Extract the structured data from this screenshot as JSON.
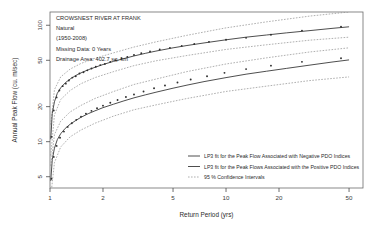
{
  "chart_data": {
    "type": "line",
    "title": "",
    "xlabel": "Return Period (yrs)",
    "ylabel": "Annual Peak Flow (cu. m/sec)",
    "xscale": "log",
    "yscale": "log",
    "xlim": [
      1.0,
      60.0
    ],
    "ylim": [
      4.0,
      130.0
    ],
    "xticks": [
      "1",
      "2",
      "5",
      "10",
      "20",
      "50"
    ],
    "xtick_values": [
      1,
      2,
      5,
      10,
      20,
      50
    ],
    "yticks": [
      "100",
      "50",
      "20",
      "10",
      "5"
    ],
    "ytick_values": [
      100,
      50,
      20,
      10,
      5
    ],
    "grid": false,
    "legend_position": "bottom-right",
    "annotations": {
      "station_name": "CROWSNEST RIVER AT FRANK",
      "regulation": "Natural",
      "period": "(1950-2008)",
      "missing_data": "Missing Data: 0 Years",
      "drainage_area": "Drainage Area: 402.7 sq. km"
    },
    "legend": [
      {
        "label": "LP3 fit for the Peak Flow Associated with Negative PDO Indices",
        "style": "solid",
        "color": "#3a3a3a"
      },
      {
        "label": "LP3 fit for the Peak Flows Associated with the Positive PDO Indices",
        "style": "solid",
        "color": "#3a3a3a"
      },
      {
        "label": "95 % Confidence Intervals",
        "style": "dashed",
        "color": "#8d8d8d"
      }
    ],
    "series": [
      {
        "name": "LP3 fit for the Peak Flow Associated with Negative PDO Indices",
        "style": "solid",
        "x": [
          1.01,
          1.03,
          1.06,
          1.1,
          1.15,
          1.22,
          1.3,
          1.4,
          1.5,
          1.65,
          1.8,
          2.0,
          2.3,
          2.6,
          3.0,
          3.5,
          4.0,
          5.0,
          6.0,
          7.5,
          10.0,
          13.0,
          17.0,
          22.0,
          30.0,
          40.0,
          50.0
        ],
        "y": [
          10.5,
          17.5,
          22.0,
          26.0,
          29.0,
          32.0,
          34.5,
          37.0,
          39.0,
          41.5,
          43.5,
          46.0,
          49.0,
          51.5,
          54.5,
          57.5,
          60.0,
          64.0,
          67.0,
          70.5,
          75.0,
          79.0,
          82.5,
          86.0,
          90.0,
          94.0,
          97.0
        ]
      },
      {
        "name": "LP3 fit for the Peak Flows Associated with the Positive PDO Indices",
        "style": "solid",
        "x": [
          1.01,
          1.03,
          1.06,
          1.1,
          1.15,
          1.22,
          1.3,
          1.4,
          1.5,
          1.65,
          1.8,
          2.0,
          2.3,
          2.6,
          3.0,
          3.5,
          4.0,
          5.0,
          6.0,
          7.5,
          10.0,
          13.0,
          17.0,
          22.0,
          30.0,
          40.0,
          50.0
        ],
        "y": [
          4.6,
          7.0,
          8.8,
          10.4,
          11.7,
          13.0,
          14.1,
          15.2,
          16.2,
          17.4,
          18.4,
          19.6,
          21.0,
          22.3,
          23.8,
          25.3,
          26.6,
          28.8,
          30.6,
          32.8,
          35.5,
          38.0,
          40.3,
          42.6,
          45.5,
          48.3,
          50.4
        ]
      },
      {
        "name": "Upper 95% CI - Negative PDO",
        "style": "dashed",
        "x": [
          1.01,
          1.06,
          1.15,
          1.3,
          1.5,
          1.8,
          2.3,
          3.0,
          4.0,
          6.0,
          10.0,
          17.0,
          30.0,
          50.0
        ],
        "y": [
          14.0,
          28.0,
          36.0,
          42.0,
          47.0,
          52.0,
          58.0,
          65.0,
          72.0,
          82.0,
          95.0,
          107.0,
          120.0,
          130.0
        ]
      },
      {
        "name": "Lower 95% CI - Negative PDO",
        "style": "dashed",
        "x": [
          1.01,
          1.06,
          1.15,
          1.3,
          1.5,
          1.8,
          2.3,
          3.0,
          4.0,
          6.0,
          10.0,
          17.0,
          30.0,
          50.0
        ],
        "y": [
          7.6,
          17.0,
          23.0,
          27.5,
          31.5,
          35.5,
          40.0,
          45.0,
          49.5,
          55.0,
          62.0,
          68.0,
          74.5,
          79.0
        ]
      },
      {
        "name": "Upper 95% CI - Positive PDO",
        "style": "dashed",
        "x": [
          1.01,
          1.06,
          1.15,
          1.3,
          1.5,
          1.8,
          2.3,
          3.0,
          4.0,
          6.0,
          10.0,
          17.0,
          30.0,
          50.0
        ],
        "y": [
          6.2,
          11.5,
          15.0,
          18.0,
          20.5,
          23.5,
          27.0,
          31.0,
          34.5,
          40.0,
          46.5,
          52.5,
          59.0,
          64.0
        ]
      },
      {
        "name": "Lower 95% CI - Positive PDO",
        "style": "dashed",
        "x": [
          1.01,
          1.06,
          1.15,
          1.3,
          1.5,
          1.8,
          2.3,
          3.0,
          4.0,
          6.0,
          10.0,
          17.0,
          30.0,
          50.0
        ],
        "y": [
          3.4,
          6.6,
          9.0,
          11.0,
          12.6,
          14.4,
          16.6,
          18.8,
          20.7,
          23.5,
          27.0,
          30.0,
          33.5,
          36.0
        ]
      }
    ],
    "scatter": [
      {
        "name": "Observed peaks - Negative PDO",
        "x": [
          1.02,
          1.05,
          1.09,
          1.13,
          1.18,
          1.23,
          1.28,
          1.34,
          1.4,
          1.47,
          1.55,
          1.63,
          1.72,
          1.82,
          1.93,
          2.05,
          2.2,
          2.35,
          2.55,
          2.75,
          3.0,
          3.3,
          3.7,
          4.2,
          4.8,
          5.6,
          6.6,
          8.0,
          10.0,
          13.0,
          18.0,
          27.0,
          45.0
        ],
        "y": [
          11.0,
          18.5,
          24.0,
          27.5,
          30.0,
          31.5,
          33.5,
          35.5,
          36.5,
          38.5,
          39.5,
          41.0,
          42.5,
          44.0,
          45.5,
          46.5,
          48.5,
          50.0,
          52.0,
          53.5,
          55.5,
          57.5,
          59.5,
          62.0,
          64.0,
          66.5,
          69.0,
          72.0,
          75.0,
          78.0,
          83.0,
          90.0,
          97.0
        ]
      },
      {
        "name": "Observed peaks - Positive PDO",
        "x": [
          1.02,
          1.05,
          1.09,
          1.14,
          1.2,
          1.26,
          1.33,
          1.41,
          1.5,
          1.6,
          1.72,
          1.85,
          2.0,
          2.2,
          2.42,
          2.7,
          3.0,
          3.4,
          3.9,
          4.5,
          5.3,
          6.3,
          7.8,
          9.8,
          13.0,
          18.0,
          27.0,
          45.0
        ],
        "y": [
          4.8,
          7.4,
          9.2,
          10.8,
          12.2,
          13.4,
          14.4,
          15.4,
          16.4,
          17.4,
          18.4,
          19.4,
          20.4,
          21.6,
          22.8,
          24.2,
          25.4,
          27.0,
          28.8,
          30.4,
          32.2,
          34.2,
          36.5,
          39.0,
          42.0,
          45.0,
          48.5,
          52.0
        ]
      }
    ]
  }
}
